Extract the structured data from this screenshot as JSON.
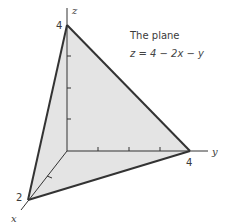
{
  "diagram": {
    "title": "The plane",
    "equation": "z = 4 − 2x − y",
    "axes": {
      "x_label": "x",
      "y_label": "y",
      "z_label": "z"
    },
    "intercepts": {
      "x": "2",
      "y": "4",
      "z": "4"
    },
    "colors": {
      "plane_fill": "#e4e4e4",
      "edge": "#333333",
      "axis": "#333333"
    }
  }
}
